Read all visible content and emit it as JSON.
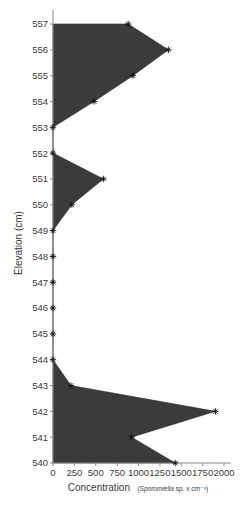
{
  "chart_data": {
    "type": "area",
    "orientation": "vertical-profile",
    "title": "",
    "xlabel": "Concentration",
    "xlabel_units_prefix": "(",
    "xlabel_units_taxon": "Sporomiella",
    "xlabel_units_suffix": " sp. x cm⁻³)",
    "ylabel": "Elevation (cm)",
    "xlim": [
      0,
      2000
    ],
    "ylim": [
      540,
      557
    ],
    "x_ticks": [
      0,
      250,
      500,
      750,
      1000,
      1250,
      1500,
      1750,
      2000
    ],
    "y_ticks": [
      540,
      541,
      542,
      543,
      544,
      545,
      546,
      547,
      548,
      549,
      550,
      551,
      552,
      553,
      554,
      555,
      556,
      557
    ],
    "grid": false,
    "legend": null,
    "fill_color": "#3b3b3b",
    "marker": "asterisk",
    "series": [
      {
        "name": "Sporomiella concentration",
        "points": [
          {
            "elevation": 557,
            "value": 880
          },
          {
            "elevation": 556,
            "value": 1350
          },
          {
            "elevation": 555,
            "value": 935
          },
          {
            "elevation": 554,
            "value": 480
          },
          {
            "elevation": 553,
            "value": 0
          },
          {
            "elevation": 552,
            "value": 0
          },
          {
            "elevation": 551,
            "value": 590
          },
          {
            "elevation": 550,
            "value": 220
          },
          {
            "elevation": 549,
            "value": 0
          },
          {
            "elevation": 548,
            "value": 0
          },
          {
            "elevation": 547,
            "value": 0
          },
          {
            "elevation": 546,
            "value": 0
          },
          {
            "elevation": 545,
            "value": 0
          },
          {
            "elevation": 544,
            "value": 0
          },
          {
            "elevation": 543,
            "value": 210
          },
          {
            "elevation": 542,
            "value": 1900
          },
          {
            "elevation": 541,
            "value": 920
          },
          {
            "elevation": 540,
            "value": 1430
          }
        ]
      }
    ]
  }
}
